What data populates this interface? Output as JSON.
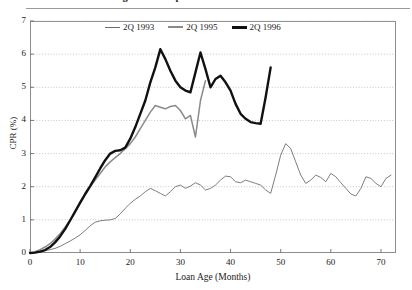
{
  "figure": {
    "title": "Figure 3.  Sample vs. Actual Default Rates",
    "background": "#ffffff"
  },
  "chart_data": {
    "type": "line",
    "title": "Figure 3.  Sample vs. Actual Default Rates",
    "xlabel": "Loan Age (Months)",
    "ylabel": "CPR (%)",
    "xlim": [
      0,
      73
    ],
    "ylim": [
      0,
      7
    ],
    "xticks": [
      0,
      10,
      20,
      30,
      40,
      50,
      60,
      70
    ],
    "yticks": [
      0,
      1,
      2,
      3,
      4,
      5,
      6,
      7
    ],
    "grid": "horizontal-dotted",
    "legend_position": "top-center-inside",
    "series": [
      {
        "name": "2Q 1993",
        "color": "#6e6e6e",
        "width": 0.9,
        "x": [
          0,
          1,
          2,
          3,
          4,
          5,
          6,
          7,
          8,
          9,
          10,
          11,
          12,
          13,
          14,
          15,
          16,
          17,
          18,
          19,
          20,
          21,
          22,
          23,
          24,
          25,
          26,
          27,
          28,
          29,
          30,
          31,
          32,
          33,
          34,
          35,
          36,
          37,
          38,
          39,
          40,
          41,
          42,
          43,
          44,
          45,
          46,
          47,
          48,
          49,
          50,
          51,
          52,
          53,
          54,
          55,
          56,
          57,
          58,
          59,
          60,
          61,
          62,
          63,
          64,
          65,
          66,
          67,
          68,
          69,
          70,
          71,
          72
        ],
        "values": [
          0.0,
          0.02,
          0.04,
          0.07,
          0.1,
          0.14,
          0.2,
          0.28,
          0.36,
          0.45,
          0.55,
          0.68,
          0.82,
          0.93,
          0.97,
          0.99,
          1.0,
          1.04,
          1.18,
          1.35,
          1.5,
          1.62,
          1.72,
          1.85,
          1.95,
          1.88,
          1.8,
          1.72,
          1.85,
          2.0,
          2.05,
          1.95,
          2.02,
          2.12,
          2.05,
          1.9,
          1.95,
          2.05,
          2.2,
          2.32,
          2.3,
          2.15,
          2.12,
          2.2,
          2.15,
          2.1,
          2.05,
          1.9,
          1.8,
          2.35,
          2.95,
          3.3,
          3.15,
          2.75,
          2.35,
          2.1,
          2.2,
          2.35,
          2.28,
          2.15,
          2.4,
          2.3,
          2.12,
          1.95,
          1.78,
          1.72,
          1.95,
          2.3,
          2.25,
          2.1,
          2.0,
          2.25,
          2.35
        ]
      },
      {
        "name": "2Q 1995",
        "color": "#8a8a8a",
        "width": 1.5,
        "x": [
          0,
          1,
          2,
          3,
          4,
          5,
          6,
          7,
          8,
          9,
          10,
          11,
          12,
          13,
          14,
          15,
          16,
          17,
          18,
          19,
          20,
          21,
          22,
          23,
          24,
          25,
          26,
          27,
          28,
          29,
          30,
          31,
          32,
          33,
          34,
          35
        ],
        "values": [
          0.0,
          0.04,
          0.1,
          0.18,
          0.28,
          0.42,
          0.58,
          0.78,
          1.0,
          1.25,
          1.5,
          1.75,
          2.0,
          2.2,
          2.4,
          2.6,
          2.75,
          2.88,
          3.0,
          3.15,
          3.3,
          3.5,
          3.75,
          4.0,
          4.25,
          4.45,
          4.4,
          4.35,
          4.42,
          4.45,
          4.3,
          4.05,
          4.15,
          3.5,
          4.6,
          5.2
        ]
      },
      {
        "name": "2Q 1996",
        "color": "#111111",
        "width": 2.4,
        "x": [
          0,
          1,
          2,
          3,
          4,
          5,
          6,
          7,
          8,
          9,
          10,
          11,
          12,
          13,
          14,
          15,
          16,
          17,
          18,
          19,
          20,
          21,
          22,
          23,
          24,
          25,
          26,
          27,
          28,
          29,
          30,
          31,
          32,
          33,
          34,
          35,
          36,
          37,
          38,
          39,
          40,
          41,
          42,
          43,
          44,
          45,
          46,
          47,
          48
        ],
        "values": [
          0.0,
          0.01,
          0.04,
          0.09,
          0.18,
          0.32,
          0.5,
          0.72,
          0.98,
          1.25,
          1.52,
          1.78,
          2.02,
          2.28,
          2.55,
          2.8,
          3.0,
          3.08,
          3.1,
          3.18,
          3.45,
          3.8,
          4.2,
          4.6,
          5.15,
          5.6,
          6.15,
          5.85,
          5.5,
          5.2,
          5.0,
          4.9,
          4.85,
          5.45,
          6.05,
          5.55,
          5.0,
          5.25,
          5.35,
          5.15,
          4.9,
          4.5,
          4.2,
          4.05,
          3.95,
          3.92,
          3.9,
          4.7,
          5.6
        ]
      }
    ]
  },
  "axes": {
    "yticks": [
      "0",
      "1",
      "2",
      "3",
      "4",
      "5",
      "6",
      "7"
    ],
    "xticks": [
      "0",
      "10",
      "20",
      "30",
      "40",
      "50",
      "60",
      "70"
    ],
    "ylabel": "CPR (%)",
    "xlabel": "Loan Age (Months)"
  },
  "legend": {
    "items": [
      {
        "label": "2Q 1993",
        "color": "#6e6e6e",
        "width": 1.1
      },
      {
        "label": "2Q 1995",
        "color": "#8a8a8a",
        "width": 2.0
      },
      {
        "label": "2Q 1996",
        "color": "#111111",
        "width": 3.0
      }
    ]
  }
}
